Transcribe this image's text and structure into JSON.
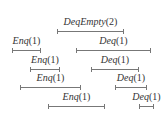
{
  "diagram": {
    "title": "",
    "operations": [
      {
        "name": "DeqEmpty",
        "arg": "(2)",
        "x1": 57,
        "x2": 124,
        "y": 31
      },
      {
        "name": "Enq",
        "arg": "(1)",
        "x1": 12,
        "x2": 41,
        "y": 50
      },
      {
        "name": "Deq",
        "arg": "(1)",
        "x1": 76,
        "x2": 151,
        "y": 50
      },
      {
        "name": "Enq",
        "arg": "(1)",
        "x1": 30,
        "x2": 60,
        "y": 69
      },
      {
        "name": "Deq",
        "arg": "(1)",
        "x1": 91,
        "x2": 139,
        "y": 69
      },
      {
        "name": "Enq",
        "arg": "(1)",
        "x1": 20,
        "x2": 81,
        "y": 87
      },
      {
        "name": "Deq",
        "arg": "(1)",
        "x1": 115,
        "x2": 147,
        "y": 87
      },
      {
        "name": "Enq",
        "arg": "(1)",
        "x1": 48,
        "x2": 105,
        "y": 106
      },
      {
        "name": "Deq",
        "arg": "(1)",
        "x1": 139,
        "x2": 154,
        "y": 106
      }
    ],
    "colors": {
      "line": "#777777",
      "text": "#333333",
      "background": "#ffffff"
    }
  }
}
